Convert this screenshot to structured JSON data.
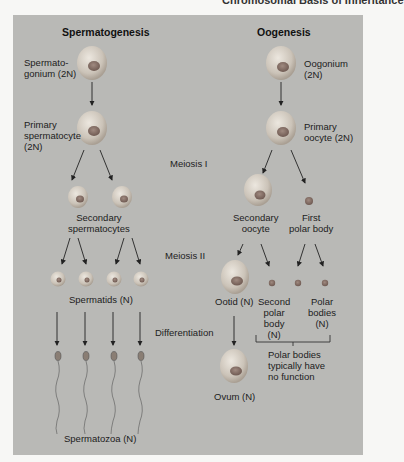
{
  "running_header": "Chromosomal Basis of Inheritance",
  "columns": {
    "left_title": "Spermatogenesis",
    "right_title": "Oogenesis"
  },
  "stages": {
    "meiosis1": "Meiosis I",
    "meiosis2": "Meiosis II",
    "differentiation": "Differentiation"
  },
  "spermatogenesis": {
    "spermatogonium": "Spermato-\ngonium (2N)",
    "primary": "Primary\nspermatocyte\n(2N)",
    "secondary": "Secondary\nspermatocytes",
    "spermatids": "Spermatids (N)",
    "spermatozoa": "Spermatozoa (N)"
  },
  "oogenesis": {
    "oogonium": "Oogonium\n(2N)",
    "primary": "Primary\noocyte (2N)",
    "secondary": "Secondary\noocyte",
    "first_polar": "First\npolar body",
    "ootid": "Ootid (N)",
    "second_polar": "Second\npolar\nbody\n(N)",
    "polar_bodies": "Polar\nbodies\n(N)",
    "polar_note": "Polar bodies\ntypically have\nno function",
    "ovum": "Ovum (N)"
  },
  "colors": {
    "panel": "#b9b9b6",
    "cell": "#cfc9c0",
    "nucleus": "#8a7268",
    "arrow": "#222222"
  }
}
